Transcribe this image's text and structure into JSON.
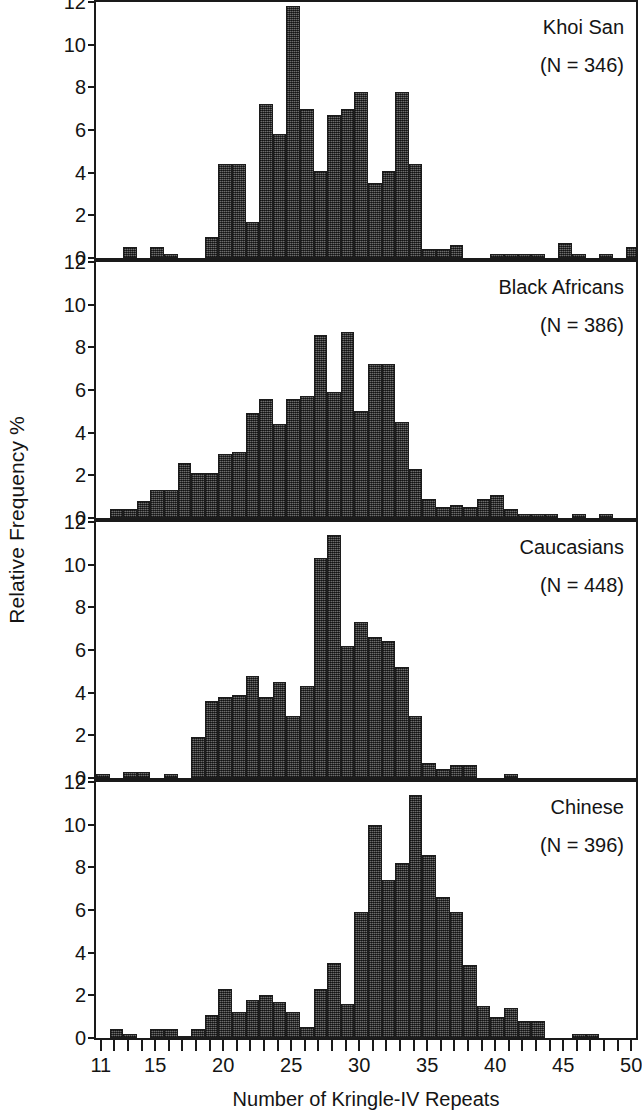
{
  "chart_data": {
    "type": "bar",
    "title": "",
    "xlabel": "Number of Kringle-IV Repeats",
    "ylabel": "Relative Frequency %",
    "xlim": [
      11,
      50
    ],
    "ylim": [
      0,
      12
    ],
    "y_ticks": [
      0,
      2,
      4,
      6,
      8,
      10,
      12
    ],
    "x_tick_labels": [
      11,
      15,
      20,
      25,
      30,
      35,
      40,
      45,
      50
    ],
    "x_minor_tick_step": 1,
    "grid": false,
    "legend": "none",
    "bar_color": "#4d4d4d",
    "panels": [
      {
        "name": "Khoi San",
        "n_label": "(N = 346)",
        "n": 346,
        "x": [
          11,
          12,
          13,
          14,
          15,
          16,
          17,
          18,
          19,
          20,
          21,
          22,
          23,
          24,
          25,
          26,
          27,
          28,
          29,
          30,
          31,
          32,
          33,
          34,
          35,
          36,
          37,
          38,
          39,
          40,
          41,
          42,
          43,
          44,
          45,
          46,
          47,
          48,
          49,
          50
        ],
        "values": [
          0,
          0,
          0.5,
          0,
          0.5,
          0.2,
          0,
          0,
          1.0,
          4.4,
          4.4,
          1.7,
          7.2,
          5.8,
          11.8,
          7.0,
          4.1,
          6.7,
          7.0,
          7.8,
          3.5,
          4.1,
          7.8,
          4.4,
          0.4,
          0.4,
          0.6,
          0,
          0,
          0.2,
          0.2,
          0.2,
          0.2,
          0,
          0.7,
          0.2,
          0,
          0.2,
          0,
          0.5
        ]
      },
      {
        "name": "Black Africans",
        "n_label": "(N = 386)",
        "n": 386,
        "x": [
          11,
          12,
          13,
          14,
          15,
          16,
          17,
          18,
          19,
          20,
          21,
          22,
          23,
          24,
          25,
          26,
          27,
          28,
          29,
          30,
          31,
          32,
          33,
          34,
          35,
          36,
          37,
          38,
          39,
          40,
          41,
          42,
          43,
          44,
          45,
          46,
          47,
          48,
          49,
          50
        ],
        "values": [
          0,
          0.4,
          0.4,
          0.8,
          1.3,
          1.3,
          2.6,
          2.1,
          2.1,
          3.0,
          3.1,
          4.9,
          5.6,
          4.4,
          5.6,
          5.7,
          8.6,
          5.9,
          8.7,
          5.0,
          7.2,
          7.2,
          4.5,
          2.3,
          0.9,
          0.5,
          0.6,
          0.5,
          0.9,
          1.1,
          0.4,
          0.2,
          0.2,
          0.2,
          0,
          0.2,
          0,
          0.2,
          0,
          0
        ]
      },
      {
        "name": "Caucasians",
        "n_label": "(N = 448)",
        "n": 448,
        "x": [
          11,
          12,
          13,
          14,
          15,
          16,
          17,
          18,
          19,
          20,
          21,
          22,
          23,
          24,
          25,
          26,
          27,
          28,
          29,
          30,
          31,
          32,
          33,
          34,
          35,
          36,
          37,
          38,
          39,
          40,
          41,
          42,
          43,
          44,
          45,
          46,
          47,
          48,
          49,
          50
        ],
        "values": [
          0.2,
          0,
          0.3,
          0.3,
          0,
          0.2,
          0,
          1.9,
          3.6,
          3.8,
          3.9,
          4.8,
          3.8,
          4.5,
          2.9,
          4.3,
          10.3,
          11.4,
          6.2,
          7.3,
          6.6,
          6.4,
          5.2,
          2.9,
          0.7,
          0.4,
          0.6,
          0.6,
          0,
          0,
          0.2,
          0,
          0,
          0,
          0,
          0,
          0,
          0,
          0,
          0
        ]
      },
      {
        "name": "Chinese",
        "n_label": "(N = 396)",
        "n": 396,
        "x": [
          11,
          12,
          13,
          14,
          15,
          16,
          17,
          18,
          19,
          20,
          21,
          22,
          23,
          24,
          25,
          26,
          27,
          28,
          29,
          30,
          31,
          32,
          33,
          34,
          35,
          36,
          37,
          38,
          39,
          40,
          41,
          42,
          43,
          44,
          45,
          46,
          47,
          48,
          49,
          50
        ],
        "values": [
          0,
          0.4,
          0.2,
          0,
          0.4,
          0.4,
          0.1,
          0.4,
          1.1,
          2.3,
          1.2,
          1.8,
          2.0,
          1.7,
          1.2,
          0.5,
          2.3,
          3.5,
          1.6,
          5.9,
          10.0,
          7.4,
          8.2,
          11.4,
          8.6,
          6.6,
          5.9,
          3.4,
          1.5,
          1.0,
          1.4,
          0.8,
          0.8,
          0,
          0,
          0.2,
          0.2,
          0,
          0,
          0
        ]
      }
    ]
  }
}
